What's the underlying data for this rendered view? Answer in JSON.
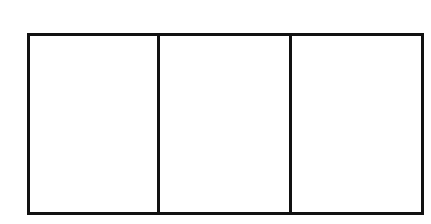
{
  "diagram": {
    "type": "three-panel-rectangle",
    "stroke_color": "#111111",
    "background_color": "#ffffff",
    "stroke_width": 3,
    "frame": {
      "left": 28,
      "top": 34,
      "right": 423,
      "bottom": 214
    },
    "panels": [
      {
        "index": 1,
        "left": 28,
        "right": 158,
        "label": ""
      },
      {
        "index": 2,
        "left": 158,
        "right": 290,
        "label": ""
      },
      {
        "index": 3,
        "left": 290,
        "right": 423,
        "label": ""
      }
    ],
    "dividers": [
      158,
      290
    ]
  }
}
